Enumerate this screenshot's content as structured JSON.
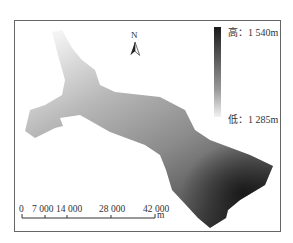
{
  "map": {
    "legend": {
      "high_label": "高：1 540m",
      "low_label": "低：1 285m",
      "gradient_colors": [
        "#1a1a1a",
        "#f2f2f2"
      ]
    },
    "north_arrow": {
      "label": "N"
    },
    "scale_bar": {
      "ticks": [
        "0",
        "7 000",
        "14 000",
        "28 000",
        "42 000"
      ],
      "unit": "m"
    }
  }
}
